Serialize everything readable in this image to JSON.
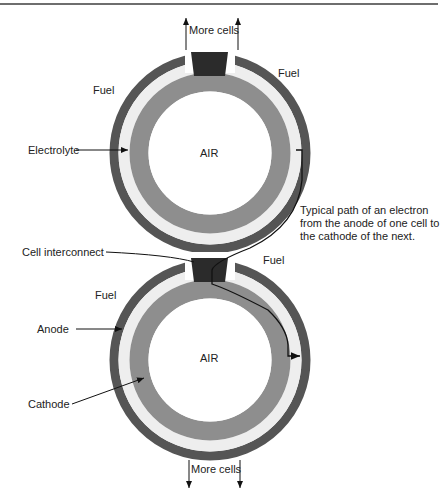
{
  "diagram": {
    "type": "tubular solid oxide fuel cell stack cross-section",
    "colors": {
      "anode": "#555555",
      "electrolyte": "#eeeeee",
      "cathode": "#8e8e8e",
      "interconnect": "#2b2b2b",
      "air": "#ffffff",
      "path": "#111111"
    },
    "labels": {
      "more_cells_top": "More cells",
      "more_cells_bottom": "More cells",
      "fuel_top_left": "Fuel",
      "fuel_top_right": "Fuel",
      "fuel_bottom_left": "Fuel",
      "fuel_bottom_right": "Fuel",
      "electrolyte": "Electrolyte",
      "air_top": "AIR",
      "air_bottom": "AIR",
      "cell_interconnect": "Cell interconnect",
      "anode": "Anode",
      "cathode": "Cathode",
      "electron_path_note": "Typical path of an electron from the anode of one cell to the cathode of the next."
    }
  }
}
